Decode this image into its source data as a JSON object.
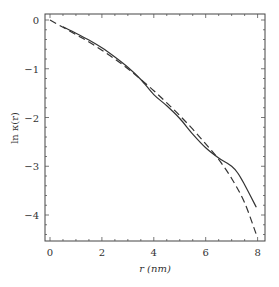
{
  "chart_data": {
    "type": "line",
    "title": "",
    "xlabel": "r (nm)",
    "ylabel": "ln κ(r)",
    "xlim": [
      -0.2,
      8.3
    ],
    "ylim": [
      -4.55,
      0.12
    ],
    "xticks": [
      0,
      2,
      4,
      6,
      8
    ],
    "yticks": [
      0,
      -1,
      -2,
      -3,
      -4
    ],
    "xtick_labels": [
      "0",
      "2",
      "4",
      "6",
      "8"
    ],
    "ytick_labels": [
      "0",
      "−1",
      "−2",
      "−3",
      "−4"
    ],
    "grid": false,
    "legend": null,
    "series": [
      {
        "name": "solid",
        "style": "solid",
        "color": "#333333",
        "x": [
          0.5,
          1.0,
          1.5,
          2.0,
          2.5,
          3.0,
          3.5,
          4.0,
          4.5,
          5.0,
          5.5,
          6.0,
          6.5,
          7.0,
          7.25,
          7.5,
          7.95
        ],
        "y": [
          -0.14,
          -0.27,
          -0.41,
          -0.57,
          -0.76,
          -0.97,
          -1.22,
          -1.53,
          -1.76,
          -2.02,
          -2.34,
          -2.62,
          -2.83,
          -3.0,
          -3.15,
          -3.38,
          -3.84
        ]
      },
      {
        "name": "dashed",
        "style": "dashed",
        "color": "#333333",
        "x": [
          0.0,
          0.5,
          1.0,
          1.5,
          2.0,
          2.5,
          3.0,
          3.5,
          4.0,
          4.5,
          5.0,
          5.5,
          6.0,
          6.5,
          7.0,
          7.5,
          7.95
        ],
        "y": [
          0.0,
          -0.15,
          -0.3,
          -0.45,
          -0.62,
          -0.8,
          -1.0,
          -1.22,
          -1.45,
          -1.7,
          -1.96,
          -2.24,
          -2.54,
          -2.86,
          -3.25,
          -3.75,
          -4.4
        ]
      }
    ]
  },
  "axes": {
    "xlabel": "r (nm)",
    "ylabel": "ln κ(r)"
  }
}
